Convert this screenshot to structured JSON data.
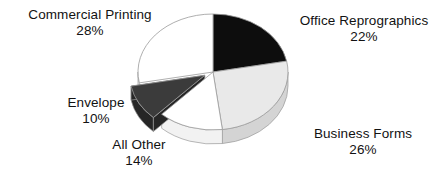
{
  "chart_data": {
    "type": "pie",
    "title": "",
    "subtitle": "",
    "xlabel": "",
    "ylabel": "",
    "legend_position": "none",
    "grid": false,
    "three_d": true,
    "start_angle_deg": 0,
    "direction": "clockwise",
    "units": "percent",
    "categories": [
      "Office Reprographics",
      "Business Forms",
      "All Other",
      "Envelope",
      "Commercial Printing"
    ],
    "values": [
      22,
      26,
      14,
      10,
      28
    ],
    "slices": [
      {
        "label": "Office Reprographics",
        "value": 22,
        "value_text": "22%",
        "color": "#0d0d0d",
        "side_color": "#000000",
        "exploded": false,
        "label_position": "right-top"
      },
      {
        "label": "Business Forms",
        "value": 26,
        "value_text": "26%",
        "color": "#e9e9e9",
        "side_color": "#d4d4d4",
        "exploded": false,
        "label_position": "right-bottom"
      },
      {
        "label": "All Other",
        "value": 14,
        "value_text": "14%",
        "color": "#ffffff",
        "side_color": "#f2f2f2",
        "exploded": false,
        "label_position": "bottom"
      },
      {
        "label": "Envelope",
        "value": 10,
        "value_text": "10%",
        "color": "#3b3b3b",
        "side_color": "#262626",
        "exploded": true,
        "label_position": "left"
      },
      {
        "label": "Commercial Printing",
        "value": 28,
        "value_text": "28%",
        "color": "#ffffff",
        "side_color": "#f2f2f2",
        "exploded": false,
        "label_position": "left-top"
      }
    ],
    "total": 100,
    "outline_color": "#9a9a9a",
    "background": "#ffffff",
    "text_color": "#121212"
  },
  "labels": {
    "commercial_printing": {
      "name": "Commercial Printing",
      "pct": "28%"
    },
    "office_reprographics": {
      "name": "Office Reprographics",
      "pct": "22%"
    },
    "business_forms": {
      "name": "Business Forms",
      "pct": "26%"
    },
    "envelope": {
      "name": "Envelope",
      "pct": "10%"
    },
    "all_other": {
      "name": "All Other",
      "pct": "14%"
    }
  }
}
